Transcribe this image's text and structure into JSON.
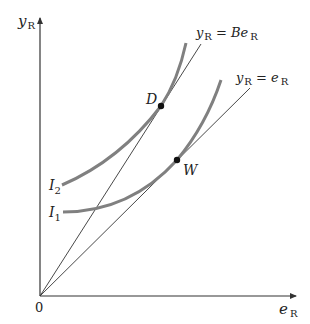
{
  "axes": {
    "y_label": "y",
    "y_label_sub": "R",
    "x_label": "e",
    "x_label_sub": "R",
    "origin_label": "0"
  },
  "lines": [
    {
      "name": "y_R = Be_R",
      "label_main": "y",
      "label_sub": "R",
      "label_eq": " = Be",
      "label_sub2": "R"
    },
    {
      "name": "y_R = e_R",
      "label_main": "y",
      "label_sub": "R",
      "label_eq": " = e",
      "label_sub2": "R"
    }
  ],
  "curves": [
    {
      "name": "I2",
      "label": "I",
      "sub": "2"
    },
    {
      "name": "I1",
      "label": "I",
      "sub": "1"
    }
  ],
  "points": [
    {
      "name": "D",
      "label": "D"
    },
    {
      "name": "W",
      "label": "W"
    }
  ],
  "colors": {
    "axis": "#333333",
    "curve": "#808080",
    "ray": "#333333",
    "point": "#111111"
  }
}
